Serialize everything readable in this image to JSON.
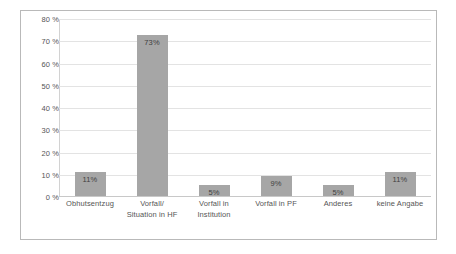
{
  "chart_data": {
    "type": "bar",
    "title": "",
    "subtitle": "",
    "xlabel": "",
    "ylabel": "",
    "categories": [
      "Obhutsentzug",
      "Vorfall/ Situation in HF",
      "Vorfall in Institution",
      "Vorfall in PF",
      "Anderes",
      "keine Angabe"
    ],
    "category_lines": [
      [
        "Obhutsentzug"
      ],
      [
        "Vorfall/",
        "Situation in HF"
      ],
      [
        "Vorfall in",
        "Institution"
      ],
      [
        "Vorfall in PF"
      ],
      [
        "Anderes"
      ],
      [
        "keine Angabe"
      ]
    ],
    "values": [
      11,
      73,
      5,
      9,
      5,
      11
    ],
    "data_labels": [
      "11%",
      "73%",
      "5%",
      "9%",
      "5%",
      "11%"
    ],
    "ylim": [
      0,
      80
    ],
    "ytick_values": [
      0,
      10,
      20,
      30,
      40,
      50,
      60,
      70,
      80
    ],
    "ytick_labels": [
      "0 %",
      "10 %",
      "20 %",
      "30 %",
      "40 %",
      "50 %",
      "60 %",
      "70 %",
      "80 %"
    ],
    "grid": true,
    "legend": false,
    "legend_position": "none",
    "colors": {
      "bar": "#a6a6a6",
      "gridline": "#e3e3e3",
      "axis": "#c8c8c8",
      "tick_text": "#555555",
      "data_label_text": "#3f3f3f",
      "frame_border": "#b9b9b9",
      "background": "#ffffff"
    }
  }
}
